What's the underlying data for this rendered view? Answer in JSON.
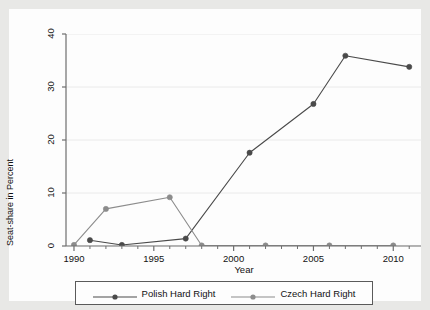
{
  "chart_data": {
    "type": "line",
    "title": "",
    "xlabel": "Year",
    "ylabel": "Seat-share in Percent",
    "xlim": [
      1989.5,
      2011.8
    ],
    "ylim": [
      0,
      40
    ],
    "xticks": [
      1990,
      1995,
      2000,
      2005,
      2010
    ],
    "xtick_labels": [
      "1990",
      "1995",
      "2000",
      "2005",
      "2010"
    ],
    "yticks": [
      0,
      10,
      20,
      30,
      40
    ],
    "ytick_labels": [
      "0",
      "10",
      "20",
      "30",
      "40"
    ],
    "grid": "horizontal",
    "legend_position": "below-outside",
    "series": [
      {
        "name": "Polish Hard Right",
        "color": "#4a4a4a",
        "marker": "circle-filled",
        "x": [
          1991,
          1993,
          1997,
          2001,
          2005,
          2007,
          2011
        ],
        "values": [
          1.1,
          0.2,
          1.4,
          17.6,
          26.8,
          35.9,
          33.8
        ]
      },
      {
        "name": "Czech Hard Right",
        "color": "#8c8c8c",
        "marker": "circle-filled",
        "x": [
          1990,
          1992,
          1996,
          1998,
          2002,
          2006,
          2010
        ],
        "values": [
          0.2,
          7.0,
          9.2,
          0.1,
          0.1,
          0.1,
          0.1
        ]
      }
    ]
  },
  "legend": {
    "entries": [
      {
        "label": "Polish Hard Right"
      },
      {
        "label": "Czech Hard Right"
      }
    ]
  },
  "axes": {
    "y_title": "Seat-share in Percent",
    "x_title": "Year"
  }
}
